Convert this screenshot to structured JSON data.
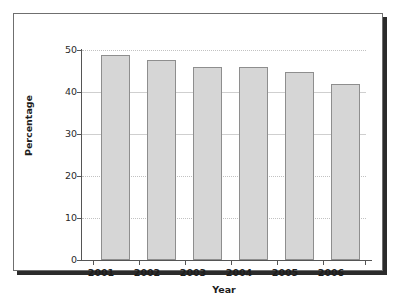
{
  "figure": {
    "frame_color": "#6f6f6f",
    "shadow_color": "#2b2b2b",
    "background": "#ffffff"
  },
  "chart_data": {
    "type": "bar",
    "title": "",
    "categories": [
      "2001",
      "2002",
      "2003",
      "2004",
      "2005",
      "2006"
    ],
    "values": [
      48.8,
      47.6,
      46.0,
      46.0,
      44.8,
      41.8
    ],
    "xlabel": "Year",
    "ylabel": "Percentage",
    "ylim": [
      0,
      50
    ],
    "yticks": [
      0,
      10,
      20,
      30,
      40,
      50
    ],
    "ytick_labels": [
      "0",
      "10",
      "20",
      "30",
      "40",
      "50"
    ],
    "grid": true,
    "grid_style": "dotted",
    "legend": null,
    "bar_fill_color": "#d6d6d6",
    "bar_edge_color": "#8e8e8e",
    "gridline_color": "#c2c2c2",
    "axis_color": "#555555"
  }
}
